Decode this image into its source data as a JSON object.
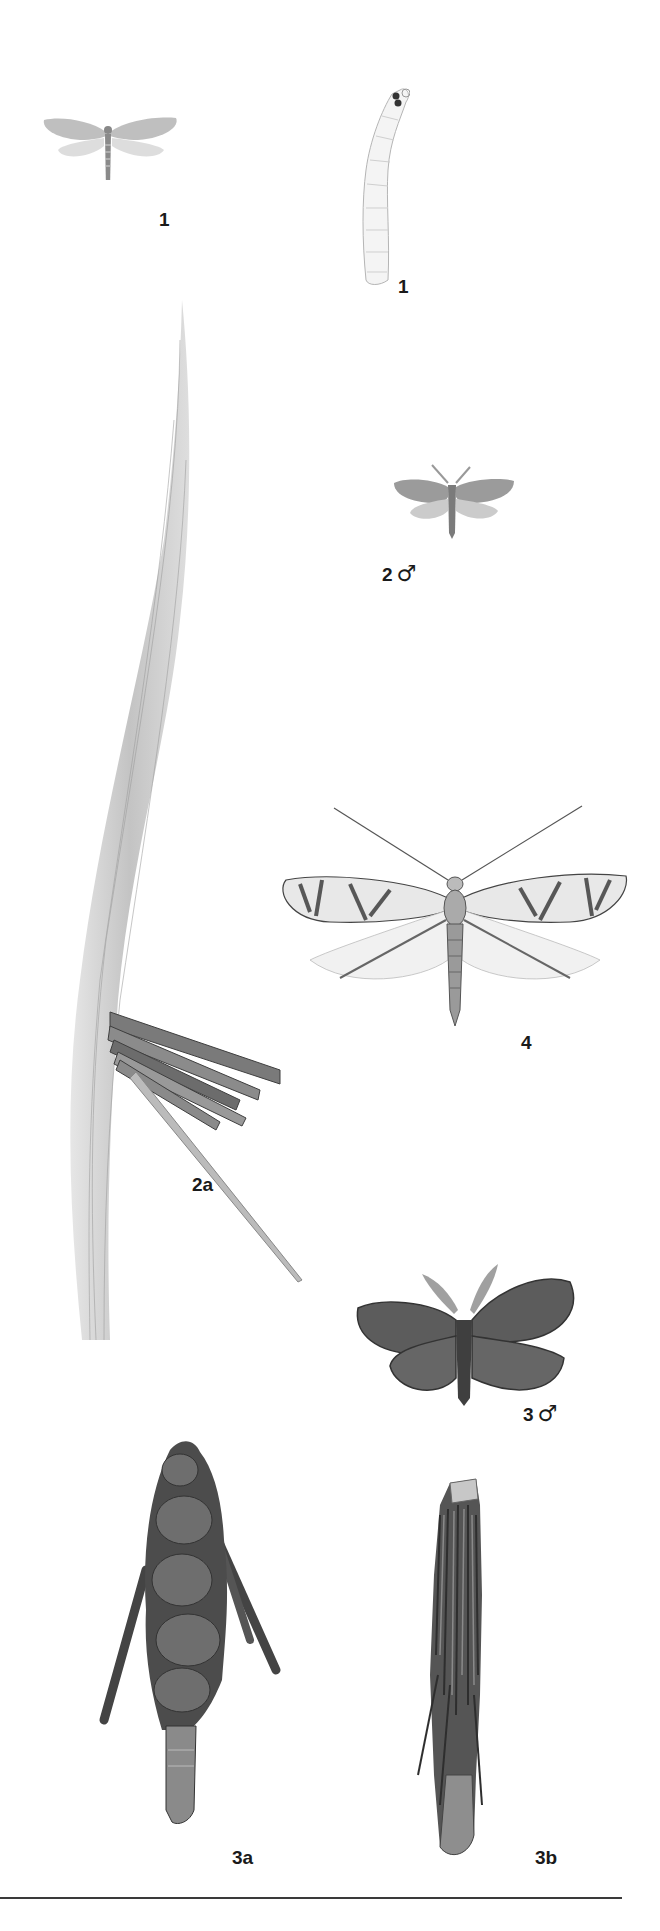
{
  "plate": {
    "background": "#ffffff",
    "ink": "#1a1a1a",
    "figures": [
      {
        "id": "fig-1-adult",
        "label": "1",
        "sex": "",
        "description": "small moth, wings spread, pale grey"
      },
      {
        "id": "fig-1-larva",
        "label": "1",
        "sex": "",
        "description": "pale caterpillar larva with dark head spots"
      },
      {
        "id": "fig-2-male",
        "label": "2",
        "sex": "♂",
        "description": "small grey moth male"
      },
      {
        "id": "fig-2a-case",
        "label": "2a",
        "sex": "",
        "description": "grass blade with bundle of stick case"
      },
      {
        "id": "fig-4-adult",
        "label": "4",
        "sex": "",
        "description": "long-antennae moth with striped forewings"
      },
      {
        "id": "fig-3-male",
        "label": "3",
        "sex": "♂",
        "description": "dark grey moth male with feathered antennae"
      },
      {
        "id": "fig-3a-case",
        "label": "3a",
        "sex": "",
        "description": "bagworm case covered with leaf fragments and twigs"
      },
      {
        "id": "fig-3b-case",
        "label": "3b",
        "sex": "",
        "description": "bagworm case covered with longitudinal stick fragments"
      }
    ]
  }
}
